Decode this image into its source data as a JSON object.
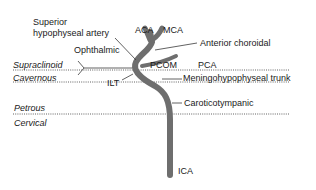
{
  "diagram": {
    "vessel_color": "#6e6e6e",
    "line_color": "#3a3a3a",
    "branches": {
      "superior_hypophyseal_line1": "Superior",
      "superior_hypophyseal_line2": "hypophyseal artery",
      "ophthalmic": "Ophthalmic",
      "aca": "ACA",
      "mca": "MCA",
      "anterior_choroidal": "Anterior choroidal",
      "pcom": "PCOM",
      "pca": "PCA",
      "ilt": "ILT",
      "meningohypophyseal": "Meningohypophyseal trunk",
      "caroticotympanic": "Caroticotympanic",
      "ica": "ICA"
    },
    "segments": {
      "supraclinoid": "Supraclinoid",
      "cavernous": "Cavernous",
      "petrous": "Petrous",
      "cervical": "Cervical"
    }
  }
}
